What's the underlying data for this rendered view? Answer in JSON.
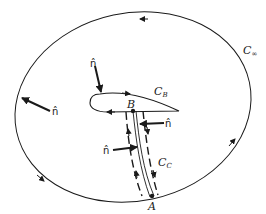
{
  "figure": {
    "colors": {
      "stroke": "#1a1a1a",
      "background": "#ffffff"
    },
    "curves": {
      "outer": {
        "name": "C",
        "subscript": "∞",
        "direction": "counter-clockwise"
      },
      "body": {
        "name": "C",
        "subscript": "B",
        "direction": "clockwise"
      },
      "cut": {
        "name": "C",
        "subscript": "C",
        "style": "dashed"
      }
    },
    "points": [
      {
        "id": "A",
        "label": "A"
      },
      {
        "id": "B",
        "label": "B"
      }
    ],
    "normals": [
      {
        "id": "outer-normal",
        "label": "n̂"
      },
      {
        "id": "body-normal",
        "label": "n̂"
      },
      {
        "id": "cut-normal-right",
        "label": "n̂"
      },
      {
        "id": "cut-normal-left",
        "label": "n̂"
      }
    ]
  }
}
